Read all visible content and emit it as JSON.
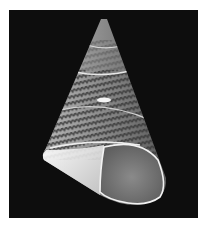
{
  "image": {
    "subject": "top shell (conical sea snail shell)",
    "background_color": "#0d0d0d",
    "border_color": "#ffffff",
    "shell_colors": {
      "body": "#8a8a8a",
      "stripes": "#3a3a3a",
      "highlight": "#f0f0f0",
      "aperture": "#7c7c7c"
    }
  }
}
